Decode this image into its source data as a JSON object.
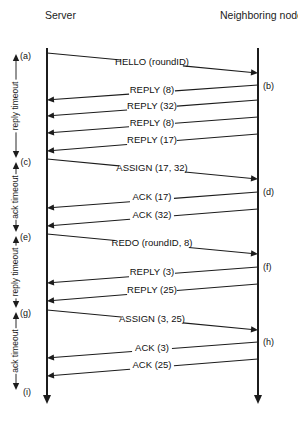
{
  "figure": {
    "width": 298,
    "height": 424,
    "background_color": "#ffffff",
    "line_color": "#1c1c1c"
  },
  "lifelines": [
    {
      "id": "server",
      "label": "Server",
      "x": 47,
      "label_x": 45,
      "label_y": 19,
      "top_y": 48,
      "bottom_y": 404
    },
    {
      "id": "neighbors",
      "label": "Neighboring nodes",
      "x": 258,
      "label_x": 220,
      "label_y": 19,
      "top_y": 48,
      "bottom_y": 404
    }
  ],
  "messages": [
    {
      "id": "m1",
      "label": "HELLO (roundID)",
      "direction": "right",
      "from_y": 53,
      "to_y": 73,
      "label_x": 152,
      "label_y": 62,
      "gap": 62
    },
    {
      "id": "m2",
      "label": "REPLY (8)",
      "direction": "left",
      "from_y": 85,
      "to_y": 100,
      "label_x": 152,
      "label_y": 90,
      "gap": 46
    },
    {
      "id": "m3",
      "label": "REPLY (32)",
      "direction": "left",
      "from_y": 100,
      "to_y": 116,
      "label_x": 152,
      "label_y": 106,
      "gap": 50
    },
    {
      "id": "m4",
      "label": "REPLY (8)",
      "direction": "left",
      "from_y": 117,
      "to_y": 133,
      "label_x": 152,
      "label_y": 123,
      "gap": 46
    },
    {
      "id": "m5",
      "label": "REPLY (17)",
      "direction": "left",
      "from_y": 134,
      "to_y": 151,
      "label_x": 152,
      "label_y": 140,
      "gap": 50
    },
    {
      "id": "m6",
      "label": "ASSIGN (17, 32)",
      "direction": "right",
      "from_y": 159,
      "to_y": 179,
      "label_x": 152,
      "label_y": 168,
      "gap": 66
    },
    {
      "id": "m7",
      "label": "ACK (17)",
      "direction": "left",
      "from_y": 192,
      "to_y": 208,
      "label_x": 152,
      "label_y": 197,
      "gap": 44
    },
    {
      "id": "m8",
      "label": "ACK (32)",
      "direction": "left",
      "from_y": 209,
      "to_y": 226,
      "label_x": 152,
      "label_y": 215,
      "gap": 44
    },
    {
      "id": "m9",
      "label": "REDO (roundID, 8)",
      "direction": "right",
      "from_y": 234,
      "to_y": 254,
      "label_x": 152,
      "label_y": 243,
      "gap": 74
    },
    {
      "id": "m10",
      "label": "REPLY (3)",
      "direction": "left",
      "from_y": 267,
      "to_y": 283,
      "label_x": 152,
      "label_y": 272,
      "gap": 46
    },
    {
      "id": "m11",
      "label": "REPLY (25)",
      "direction": "left",
      "from_y": 284,
      "to_y": 301,
      "label_x": 152,
      "label_y": 290,
      "gap": 50
    },
    {
      "id": "m12",
      "label": "ASSIGN (3, 25)",
      "direction": "right",
      "from_y": 310,
      "to_y": 330,
      "label_x": 152,
      "label_y": 319,
      "gap": 62
    },
    {
      "id": "m13",
      "label": "ACK (3)",
      "direction": "left",
      "from_y": 342,
      "to_y": 358,
      "label_x": 152,
      "label_y": 348,
      "gap": 40
    },
    {
      "id": "m14",
      "label": "ACK (25)",
      "direction": "left",
      "from_y": 359,
      "to_y": 376,
      "label_x": 152,
      "label_y": 365,
      "gap": 44
    }
  ],
  "markers": [
    {
      "id": "a",
      "label": "(a)",
      "x": 31,
      "y": 56,
      "side": "left"
    },
    {
      "id": "b",
      "label": "(b)",
      "x": 263,
      "y": 86,
      "side": "right"
    },
    {
      "id": "c",
      "label": "(c)",
      "x": 31,
      "y": 162,
      "side": "left"
    },
    {
      "id": "d",
      "label": "(d)",
      "x": 263,
      "y": 192,
      "side": "right"
    },
    {
      "id": "e",
      "label": "(e)",
      "x": 31,
      "y": 237,
      "side": "left"
    },
    {
      "id": "f",
      "label": "(f)",
      "x": 263,
      "y": 267,
      "side": "right"
    },
    {
      "id": "g",
      "label": "(g)",
      "x": 31,
      "y": 313,
      "side": "left"
    },
    {
      "id": "h",
      "label": "(h)",
      "x": 263,
      "y": 342,
      "side": "right"
    },
    {
      "id": "i",
      "label": "(i)",
      "x": 31,
      "y": 392,
      "side": "left"
    }
  ],
  "timeouts": [
    {
      "id": "t1",
      "label": "reply timeout",
      "x": 16,
      "top_y": 54,
      "bottom_y": 158
    },
    {
      "id": "t2",
      "label": "ack timeout",
      "x": 16,
      "top_y": 162,
      "bottom_y": 232
    },
    {
      "id": "t3",
      "label": "reply timeout",
      "x": 16,
      "top_y": 236,
      "bottom_y": 308
    },
    {
      "id": "t4",
      "label": "ack timeout",
      "x": 16,
      "top_y": 312,
      "bottom_y": 390
    }
  ]
}
